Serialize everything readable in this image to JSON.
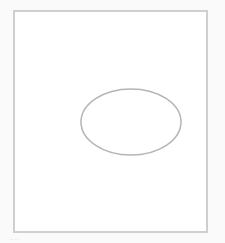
{
  "canvas": {
    "frame_color": "#cfcfcf",
    "background": "#ffffff",
    "shape": {
      "type": "ellipse",
      "cx": 131,
      "cy": 122,
      "rx": 50,
      "ry": 33,
      "stroke": "#b5b5b5"
    }
  },
  "caption": {
    "text": "····"
  }
}
